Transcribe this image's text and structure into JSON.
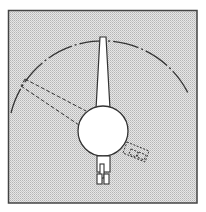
{
  "diagram": {
    "title": "",
    "colors": {
      "background": "#ffffff",
      "panel_fill": "#d9d9d9",
      "stroke": "#333333",
      "shape_fill": "#ffffff"
    },
    "elements": {
      "frame": {
        "x": 8,
        "y": 10,
        "width": 189,
        "height": 193
      },
      "hub": {
        "cx": 103,
        "cy": 131,
        "r": 25
      },
      "main_boom": {
        "base_left": 96,
        "base_right": 110,
        "tip_left": 100,
        "tip_right": 106,
        "top_y": 37,
        "base_y": 108
      },
      "swing_arc": {
        "cx": 103,
        "cy": 131,
        "r": 95,
        "start": [
          11,
          113
        ],
        "end": [
          188,
          93
        ]
      },
      "alt_boom_dashed": {
        "from": [
          24,
          80
        ],
        "to": [
          81,
          120
        ]
      },
      "rear_unit": {
        "x": 96,
        "y": 155,
        "width": 14,
        "height": 30
      },
      "side_unit_dashed": {
        "x": 126,
        "y": 140,
        "width": 22,
        "height": 20
      }
    }
  }
}
